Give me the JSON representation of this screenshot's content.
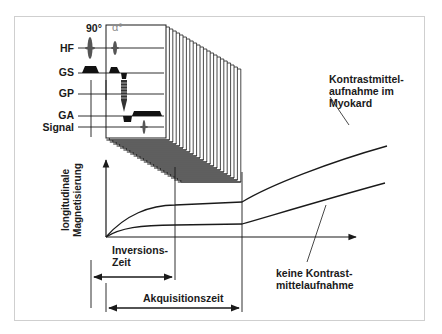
{
  "diagram": {
    "pulse_sequence": {
      "flip_angle_prep": "90°",
      "flip_angle_readout": "α°",
      "rows": [
        {
          "label": "HF"
        },
        {
          "label": "GS"
        },
        {
          "label": "GP"
        },
        {
          "label": "GA"
        },
        {
          "label": "Signal"
        }
      ]
    },
    "plot": {
      "y_axis_label_line1": "longitudinale",
      "y_axis_label_line2": "Magnetisierung",
      "curve_upper_label_line1": "Kontrastmittel-",
      "curve_upper_label_line2": "aufnahme im",
      "curve_upper_label_line3": "Myokard",
      "curve_lower_label_line1": "keine Kontrast-",
      "curve_lower_label_line2": "mittelaufnahme",
      "interval_inversion_line1": "Inversions-",
      "interval_inversion_line2": "Zeit",
      "interval_acquisition": "Akquisitionszeit"
    },
    "colors": {
      "line": "#1a1a1a",
      "frame": "#cfcfcf",
      "alpha_label": "#8a8a8a"
    }
  }
}
